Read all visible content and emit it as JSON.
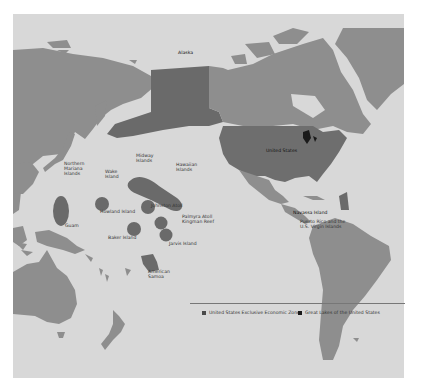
{
  "map": {
    "title": "United States Exclusive Economic Zone",
    "colors": {
      "ocean": "#d8d8d8",
      "land": "#8e8e8e",
      "us_land": "#6e6e6e",
      "eez": "#6a6a6a",
      "great_lakes": "#1a1a1a",
      "page_background": "#ffffff"
    },
    "labels": {
      "alaska": "Alaska",
      "united_states": "United States",
      "northern_mariana": "Northern\nMariana\nIslands",
      "guam": "Guam",
      "wake": "Wake\nIsland",
      "midway": "Midway\nIslands",
      "hawaiian": "Hawaiian\nIslands",
      "johnston": "Johnston Atoll",
      "howland": "Howland Island",
      "palmyra": "Palmyra Atoll\nKingman Reef",
      "baker": "Baker Island",
      "jarvis": "Jarvis Island",
      "american_samoa": "American\nSamoa",
      "navassa": "Navassa Island",
      "puerto_rico": "Puerto Rico and the\nU.S. Virgin Islands"
    },
    "legend": [
      {
        "label": "United States Exclusive Economic Zone",
        "color": "#4a4a4a"
      },
      {
        "label": "Great Lakes of the United States",
        "color": "#1a1a1a"
      }
    ]
  }
}
